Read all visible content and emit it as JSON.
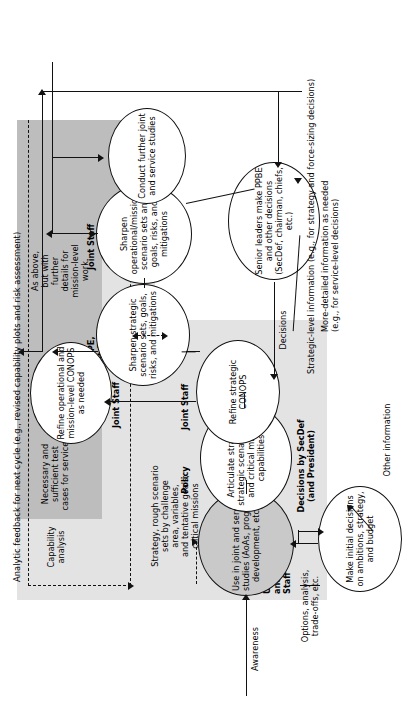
{
  "diagram": {
    "title": "Analytic feedback for next cycle (e.g., revised capability plots and risk assessment)",
    "type": "flowchart",
    "orientation": "rotated-90-ccw"
  },
  "nodes": {
    "use_studies": "Use in joint\nand service studies\n(AoAs, program\ndevelopment, etc.)",
    "articulate": "Articulate strategy,\nstrategic scenario sets,\nand critical mission\ncapabilities",
    "refine_conops": "Refine strategic\nCONOPS",
    "sharpen_strategic": "Sharpen\nstrategic scenario\nsets, goals, risks,\nand mitigations",
    "refine_op_conops": "Refine operational\nand mission-level\nCONOPS as needed",
    "sharpen_operational": "Sharpen\noperational/mission\nscenario sets and\ngoals, risks, and\nmitigations",
    "conduct_further": "Conduct further\njoint and service\nstudies",
    "make_initial": "Make initial decisions\non ambitions, strategy,\nand budget",
    "senior_leaders": "Senior leaders\nmake PPBE and other\ndecisions (SecDef,\nchairman, chiefs, etc.)"
  },
  "actors": {
    "cape_policy_task_force": "CAPE-Policy\ntask force\nwith\nUSD(AT&L)\nand Joint\nStaff",
    "policy": "Policy",
    "joint_staff_1": "Joint Staff",
    "cape_joint_staff": "CAPE,\nJoint Staff",
    "joint_staff_2": "Joint Staff",
    "joint_staff_3": "Joint Staff"
  },
  "annotations": {
    "strategy_rough": "Strategy, rough scenario\nsets by challenge\narea, variables,\nand tentative goals;\ncritical missions",
    "capability_analysis": "Capability\nanalysis",
    "necessary_sufficient": "Necessary and\nsufficient test\ncases for services",
    "risk_assessment": "Risk assessment",
    "as_above": "As above,\nbut with\nfurther\ndetails for\nmission-level\nwork",
    "awareness": "Awareness",
    "options_analysis": "Options, analysis,\ntrade-offs, etc.",
    "decisions_by_secdef": "Decisions by SecDef\n(and President)",
    "other_information": "Other information",
    "decisions": "Decisions",
    "more_detailed": "More-detailed information as needed\n(e.g., for service-level decisions)",
    "strategic_level": "Strategic-level information (e.g., for strategy and force-sizing decisions)"
  },
  "colors": {
    "band_light": "#e3e3e3",
    "band_dark": "#bdbdbd",
    "node_fill_gray": "#c9c9c9",
    "stroke": "#111111",
    "background": "#ffffff"
  }
}
